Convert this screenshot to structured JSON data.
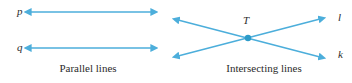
{
  "figure": {
    "stroke_color": "#4CAEDB",
    "text_color": "#2b2b2b",
    "background_color": "#ffffff"
  },
  "parallel_panel": {
    "caption": "Parallel lines",
    "lines": [
      {
        "label": "p",
        "x1": 30,
        "y1": 12,
        "x2": 152,
        "y2": 12,
        "arrow_start": true,
        "arrow_end": true
      },
      {
        "label": "q",
        "x1": 30,
        "y1": 48,
        "x2": 152,
        "y2": 48,
        "arrow_start": true,
        "arrow_end": true
      }
    ]
  },
  "intersecting_panel": {
    "caption": "Intersecting lines",
    "point_label": "T",
    "point": {
      "x": 248,
      "y": 38
    },
    "lines": [
      {
        "label": "l",
        "x1": 178,
        "y1": 56,
        "x2": 320,
        "y2": 19,
        "arrow_start": true,
        "arrow_end": true
      },
      {
        "label": "k",
        "x1": 178,
        "y1": 20,
        "x2": 320,
        "y2": 57,
        "arrow_start": true,
        "arrow_end": true
      }
    ]
  }
}
